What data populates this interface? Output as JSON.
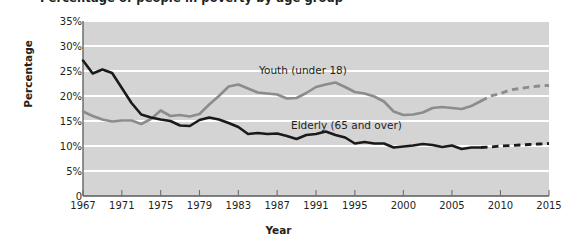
{
  "chart_data": {
    "type": "line",
    "title": "Percentage of people in poverty by age group",
    "xlabel": "Year",
    "ylabel": "Percentage",
    "xlim": [
      1967,
      2015
    ],
    "ylim": [
      0,
      35
    ],
    "ytick_labels": [
      "35%",
      "30%",
      "25%",
      "20%",
      "15%",
      "10%",
      "5%",
      "0"
    ],
    "ytick_values": [
      35,
      30,
      25,
      20,
      15,
      10,
      5,
      0
    ],
    "xtick_labels": [
      "1967",
      "1971",
      "1975",
      "1979",
      "1983",
      "1987",
      "1991",
      "1995",
      "2000",
      "2005",
      "2010",
      "2015"
    ],
    "xtick_values": [
      1967,
      1971,
      1975,
      1979,
      1983,
      1987,
      1991,
      1995,
      2000,
      2005,
      2010,
      2015
    ],
    "grid": "horizontal",
    "legend": "inline-labels",
    "plot_background": "#d4d4d4",
    "gridline_color": "#ffffff",
    "series": [
      {
        "name": "Youth (under 18)",
        "label": "Youth (under 18)",
        "color": "#8c8c8c",
        "style": "solid-then-dashed",
        "dash_begins": 2008,
        "x": [
          1967,
          1968,
          1969,
          1970,
          1971,
          1972,
          1973,
          1974,
          1975,
          1976,
          1977,
          1978,
          1979,
          1980,
          1981,
          1982,
          1983,
          1984,
          1985,
          1986,
          1987,
          1988,
          1989,
          1990,
          1991,
          1992,
          1993,
          1994,
          1995,
          1996,
          1997,
          1998,
          1999,
          2000,
          2001,
          2002,
          2003,
          2004,
          2005,
          2006,
          2007,
          2008,
          2009,
          2010,
          2011,
          2012,
          2013,
          2014,
          2015
        ],
        "y": [
          16.9,
          16.0,
          15.3,
          14.9,
          15.1,
          15.1,
          14.4,
          15.4,
          17.1,
          16.0,
          16.2,
          15.9,
          16.4,
          18.3,
          20.0,
          21.9,
          22.3,
          21.5,
          20.7,
          20.5,
          20.3,
          19.5,
          19.6,
          20.6,
          21.8,
          22.3,
          22.7,
          21.8,
          20.8,
          20.5,
          19.9,
          18.9,
          16.9,
          16.2,
          16.3,
          16.7,
          17.6,
          17.8,
          17.6,
          17.4,
          18.0,
          19.0,
          20.0,
          20.5,
          21.2,
          21.5,
          21.8,
          22.0,
          22.1
        ]
      },
      {
        "name": "Elderly (65 and over)",
        "label": "Elderly (65 and over)",
        "color": "#1a1a1a",
        "style": "solid-then-dashed",
        "dash_begins": 2008,
        "x": [
          1967,
          1968,
          1969,
          1970,
          1971,
          1972,
          1973,
          1974,
          1975,
          1976,
          1977,
          1978,
          1979,
          1980,
          1981,
          1982,
          1983,
          1984,
          1985,
          1986,
          1987,
          1988,
          1989,
          1990,
          1991,
          1992,
          1993,
          1994,
          1995,
          1996,
          1997,
          1998,
          1999,
          2000,
          2001,
          2002,
          2003,
          2004,
          2005,
          2006,
          2007,
          2008,
          2009,
          2010,
          2011,
          2012,
          2013,
          2014,
          2015
        ],
        "y": [
          27.1,
          24.5,
          25.3,
          24.6,
          21.6,
          18.6,
          16.3,
          15.7,
          15.3,
          15.0,
          14.1,
          14.0,
          15.2,
          15.7,
          15.3,
          14.6,
          13.8,
          12.4,
          12.6,
          12.4,
          12.5,
          12.0,
          11.4,
          12.2,
          12.4,
          12.9,
          12.2,
          11.7,
          10.5,
          10.8,
          10.5,
          10.5,
          9.7,
          9.9,
          10.1,
          10.4,
          10.2,
          9.8,
          10.1,
          9.4,
          9.7,
          9.7,
          9.8,
          10.0,
          10.1,
          10.2,
          10.3,
          10.4,
          10.5
        ]
      }
    ]
  }
}
